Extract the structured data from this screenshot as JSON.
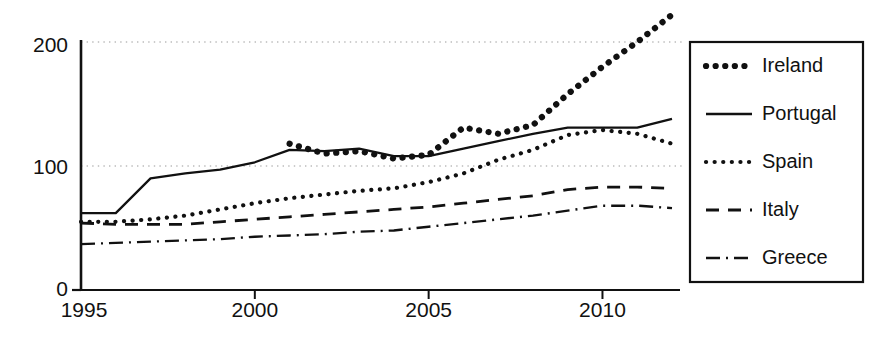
{
  "chart_data": {
    "type": "line",
    "title": "",
    "subtitle": "",
    "xlabel": "",
    "ylabel": "",
    "xlim": [
      1995,
      2012
    ],
    "ylim": [
      0,
      215
    ],
    "yticks": [
      0,
      100,
      200
    ],
    "ytick_labels": [
      "0",
      "100",
      "200"
    ],
    "xticks": [
      1995,
      2000,
      2005,
      2010
    ],
    "xtick_labels": [
      "1995",
      "2000",
      "2005",
      "2010"
    ],
    "gridlines": {
      "horizontal_at": [
        100,
        200
      ],
      "style": "dotted",
      "vertical": false
    },
    "legend": {
      "position": "right-outside",
      "border": true
    },
    "x": [
      1995,
      1996,
      1997,
      1998,
      1999,
      2000,
      2001,
      2002,
      2003,
      2004,
      2005,
      2006,
      2007,
      2008,
      2009,
      2010,
      2011,
      2012
    ],
    "series": [
      {
        "name": "Ireland",
        "linestyle": "thick-dotted",
        "color": "#111111",
        "values": [
          null,
          null,
          null,
          null,
          null,
          null,
          118,
          110,
          112,
          106,
          109,
          131,
          126,
          133,
          158,
          180,
          200,
          222
        ]
      },
      {
        "name": "Portugal",
        "linestyle": "solid",
        "color": "#111111",
        "values": [
          62,
          62,
          90,
          94,
          97,
          103,
          113,
          112,
          114,
          108,
          108,
          114,
          120,
          126,
          131,
          131,
          131,
          138
        ]
      },
      {
        "name": "Spain",
        "linestyle": "dotted",
        "color": "#111111",
        "values": [
          55,
          55,
          57,
          60,
          65,
          70,
          74,
          77,
          80,
          82,
          87,
          94,
          105,
          113,
          125,
          129,
          126,
          118
        ]
      },
      {
        "name": "Italy",
        "linestyle": "dashed",
        "color": "#111111",
        "values": [
          54,
          53,
          53,
          53,
          55,
          57,
          59,
          61,
          63,
          65,
          67,
          70,
          73,
          76,
          81,
          83,
          83,
          82
        ]
      },
      {
        "name": "Greece",
        "linestyle": "dash-dot",
        "color": "#111111",
        "values": [
          37,
          38,
          39,
          40,
          41,
          43,
          44,
          45,
          47,
          48,
          51,
          54,
          57,
          60,
          64,
          68,
          68,
          66
        ]
      }
    ]
  },
  "axes": {
    "y_tick_0": "0",
    "y_tick_100": "100",
    "y_tick_200": "200",
    "x_tick_1995": "1995",
    "x_tick_2000": "2000",
    "x_tick_2005": "2005",
    "x_tick_2010": "2010"
  },
  "legend": {
    "items": [
      {
        "label": "Ireland",
        "style": "thick-dotted"
      },
      {
        "label": "Portugal",
        "style": "solid"
      },
      {
        "label": "Spain",
        "style": "dotted"
      },
      {
        "label": "Italy",
        "style": "dashed"
      },
      {
        "label": "Greece",
        "style": "dash-dot"
      }
    ]
  }
}
